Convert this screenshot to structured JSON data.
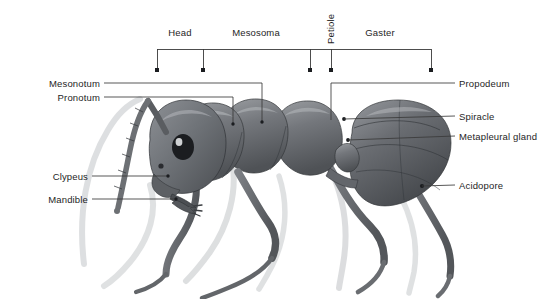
{
  "figure": {
    "background_color": "#ffffff",
    "line_color": "#3a3a3a",
    "text_color": "#1e1e1e"
  },
  "top_brackets": {
    "regions": [
      {
        "key": "head",
        "label": "Head",
        "label_x": 180,
        "label_y": 34,
        "orientation": "horizontal"
      },
      {
        "key": "mesosoma",
        "label": "Mesosoma",
        "label_x": 256,
        "label_y": 34,
        "orientation": "horizontal"
      },
      {
        "key": "petiole",
        "label": "Petiole",
        "label_x": 322,
        "label_y": 36,
        "orientation": "vertical"
      },
      {
        "key": "gaster",
        "label": "Gaster",
        "label_x": 380,
        "label_y": 34,
        "orientation": "horizontal"
      }
    ],
    "rail_y": 49,
    "tick_bottom_y": 71,
    "tick_x_positions": [
      157,
      203,
      310,
      331,
      431
    ]
  },
  "left_labels": [
    {
      "key": "mesonotum",
      "label": "Mesonotum",
      "text_x": 98,
      "text_y": 83
    },
    {
      "key": "pronotum",
      "label": "Pronotum",
      "text_x": 98,
      "text_y": 97
    },
    {
      "key": "clypeus",
      "label": "Clypeus",
      "text_x": 85,
      "text_y": 176
    },
    {
      "key": "mandible",
      "label": "Mandible",
      "text_x": 85,
      "text_y": 199
    }
  ],
  "right_labels": [
    {
      "key": "propodeum",
      "label": "Propodeum",
      "text_x": 459,
      "text_y": 83
    },
    {
      "key": "spiracle",
      "label": "Spiracle",
      "text_x": 459,
      "text_y": 116
    },
    {
      "key": "metapleural_gland",
      "label": "Metapleural gland",
      "text_x": 459,
      "text_y": 136
    },
    {
      "key": "acidopore",
      "label": "Acidopore",
      "text_x": 459,
      "text_y": 185
    }
  ]
}
